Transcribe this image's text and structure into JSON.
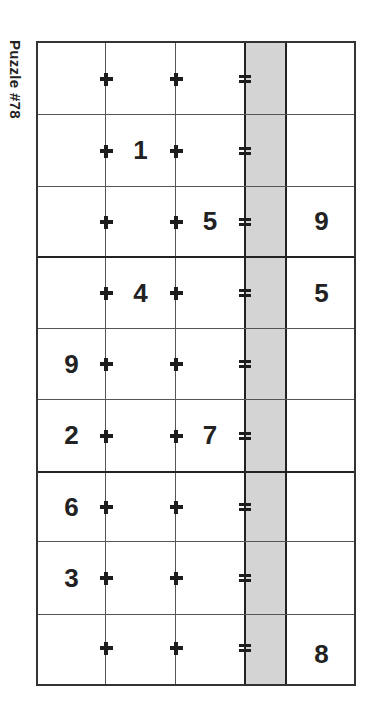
{
  "puzzle": {
    "title": "Puzzle #78",
    "colors": {
      "grid_line": "#333333",
      "shade": "#d4d4d4",
      "text": "#222222"
    },
    "operators": {
      "first": "+",
      "second": "+",
      "result": "="
    },
    "rows": [
      {
        "a": "",
        "b": "",
        "c": "",
        "answer": ""
      },
      {
        "a": "",
        "b": "1",
        "c": "",
        "answer": ""
      },
      {
        "a": "",
        "b": "",
        "c": "5",
        "answer": "9"
      },
      {
        "a": "",
        "b": "4",
        "c": "",
        "answer": "5"
      },
      {
        "a": "9",
        "b": "",
        "c": "",
        "answer": ""
      },
      {
        "a": "2",
        "b": "",
        "c": "7",
        "answer": ""
      },
      {
        "a": "6",
        "b": "",
        "c": "",
        "answer": ""
      },
      {
        "a": "3",
        "b": "",
        "c": "",
        "answer": ""
      },
      {
        "a": "",
        "b": "",
        "c": "",
        "answer": "8"
      }
    ]
  }
}
